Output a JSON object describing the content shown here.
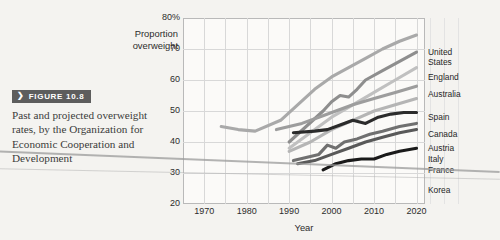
{
  "figure": {
    "badge_chevron": "❯",
    "badge_label": "FIGURE 10.8",
    "caption": "Past and projected overweight rates, by the Organization for Economic Cooperation and Development"
  },
  "chart_data": {
    "type": "line",
    "title": "",
    "xlabel": "Year",
    "ylabel": "Proportion overweight",
    "xlim": [
      1965,
      2022
    ],
    "ylim": [
      20,
      80
    ],
    "xticks": [
      1970,
      1980,
      1990,
      2000,
      2010,
      2020
    ],
    "xtick_labels": [
      "1970",
      "1980",
      "1990",
      "2000",
      "2010",
      "2020"
    ],
    "yticks": [
      20,
      30,
      40,
      50,
      60,
      70,
      80
    ],
    "ytick_labels": [
      "20",
      "30",
      "40",
      "50",
      "60",
      "70",
      "80%"
    ],
    "grid": true,
    "legend_position": "right-outside",
    "series": [
      {
        "name": "United States",
        "color": "#a9a9a9",
        "label_y": 30,
        "points": [
          [
            1974,
            45
          ],
          [
            1978,
            44
          ],
          [
            1982,
            43.5
          ],
          [
            1988,
            47
          ],
          [
            1992,
            52
          ],
          [
            1996,
            57
          ],
          [
            2000,
            61
          ],
          [
            2004,
            64
          ],
          [
            2008,
            67
          ],
          [
            2012,
            70
          ],
          [
            2016,
            72.5
          ],
          [
            2020,
            74.5
          ]
        ]
      },
      {
        "name": "England",
        "color": "#8e8e8e",
        "label_y": 55,
        "points": [
          [
            1990,
            40
          ],
          [
            1994,
            45
          ],
          [
            1998,
            50
          ],
          [
            2000,
            53
          ],
          [
            2002,
            55
          ],
          [
            2004,
            54.5
          ],
          [
            2006,
            57
          ],
          [
            2008,
            60
          ],
          [
            2012,
            63
          ],
          [
            2016,
            66
          ],
          [
            2020,
            69
          ]
        ]
      },
      {
        "name": "Australia",
        "color": "#c0c0c0",
        "label_y": 72,
        "points": [
          [
            1990,
            38
          ],
          [
            1995,
            43
          ],
          [
            2000,
            48
          ],
          [
            2005,
            52
          ],
          [
            2010,
            56
          ],
          [
            2015,
            60
          ],
          [
            2020,
            64
          ]
        ]
      },
      {
        "name": "Spain",
        "color": "#9d9d9d",
        "label_y": 95,
        "points": [
          [
            1987,
            44
          ],
          [
            1993,
            46
          ],
          [
            1997,
            48
          ],
          [
            2001,
            50
          ],
          [
            2005,
            52
          ],
          [
            2010,
            54
          ],
          [
            2015,
            56
          ],
          [
            2020,
            58
          ]
        ]
      },
      {
        "name": "Canada",
        "color": "#b5b5b5",
        "label_y": 112,
        "points": [
          [
            1990,
            37
          ],
          [
            1995,
            40
          ],
          [
            2000,
            44
          ],
          [
            2005,
            47
          ],
          [
            2010,
            50
          ],
          [
            2015,
            52
          ],
          [
            2020,
            54
          ]
        ]
      },
      {
        "name": "Austria",
        "color": "#2b2b2b",
        "label_y": 126,
        "points": [
          [
            1991,
            43
          ],
          [
            1996,
            43.5
          ],
          [
            1999,
            44
          ],
          [
            2002,
            45.5
          ],
          [
            2005,
            47
          ],
          [
            2008,
            46
          ],
          [
            2011,
            48
          ],
          [
            2014,
            49
          ],
          [
            2017,
            49.5
          ],
          [
            2020,
            49.5
          ]
        ]
      },
      {
        "name": "Italy",
        "color": "#707070",
        "label_y": 137,
        "points": [
          [
            1991,
            34
          ],
          [
            1994,
            35
          ],
          [
            1997,
            36
          ],
          [
            1999,
            39
          ],
          [
            2001,
            38
          ],
          [
            2003,
            40
          ],
          [
            2006,
            41
          ],
          [
            2009,
            42.5
          ],
          [
            2012,
            43.5
          ],
          [
            2016,
            45
          ],
          [
            2020,
            46
          ]
        ]
      },
      {
        "name": "France",
        "color": "#595959",
        "label_y": 148,
        "points": [
          [
            1992,
            33
          ],
          [
            1996,
            34
          ],
          [
            2000,
            36
          ],
          [
            2004,
            38
          ],
          [
            2008,
            40
          ],
          [
            2012,
            41.5
          ],
          [
            2016,
            43
          ],
          [
            2020,
            44
          ]
        ]
      },
      {
        "name": "Korea",
        "color": "#1a1a1a",
        "label_y": 168,
        "points": [
          [
            1998,
            31
          ],
          [
            2001,
            33
          ],
          [
            2004,
            34
          ],
          [
            2007,
            34.5
          ],
          [
            2010,
            34.5
          ],
          [
            2013,
            36
          ],
          [
            2016,
            37
          ],
          [
            2020,
            38
          ]
        ]
      }
    ]
  }
}
